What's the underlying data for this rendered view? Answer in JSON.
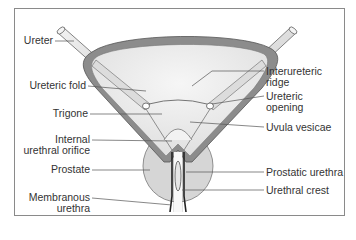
{
  "figure": {
    "type": "anatomical-diagram",
    "colors": {
      "frame": "#8a8a8a",
      "wall": "#8c8c8c",
      "wall_inner": "#cfcfcf",
      "lumen": "#ececec",
      "prostate": "#d6d6d6",
      "leader": "#555555",
      "text": "#333333"
    }
  },
  "labels": {
    "left": {
      "ureter": "Ureter",
      "ureteric_fold": "Ureteric fold",
      "trigone": "Trigone",
      "internal_orifice_1": "Internal",
      "internal_orifice_2": "urethral orifice",
      "prostate": "Prostate",
      "membranous_1": "Membranous",
      "membranous_2": "urethra"
    },
    "right": {
      "interureteric_1": "Interureteric",
      "interureteric_2": "ridge",
      "ureteric_opening_1": "Ureteric",
      "ureteric_opening_2": "opening",
      "uvula": "Uvula vesicae",
      "prostatic_urethra": "Prostatic urethra",
      "urethral_crest": "Urethral crest"
    }
  }
}
